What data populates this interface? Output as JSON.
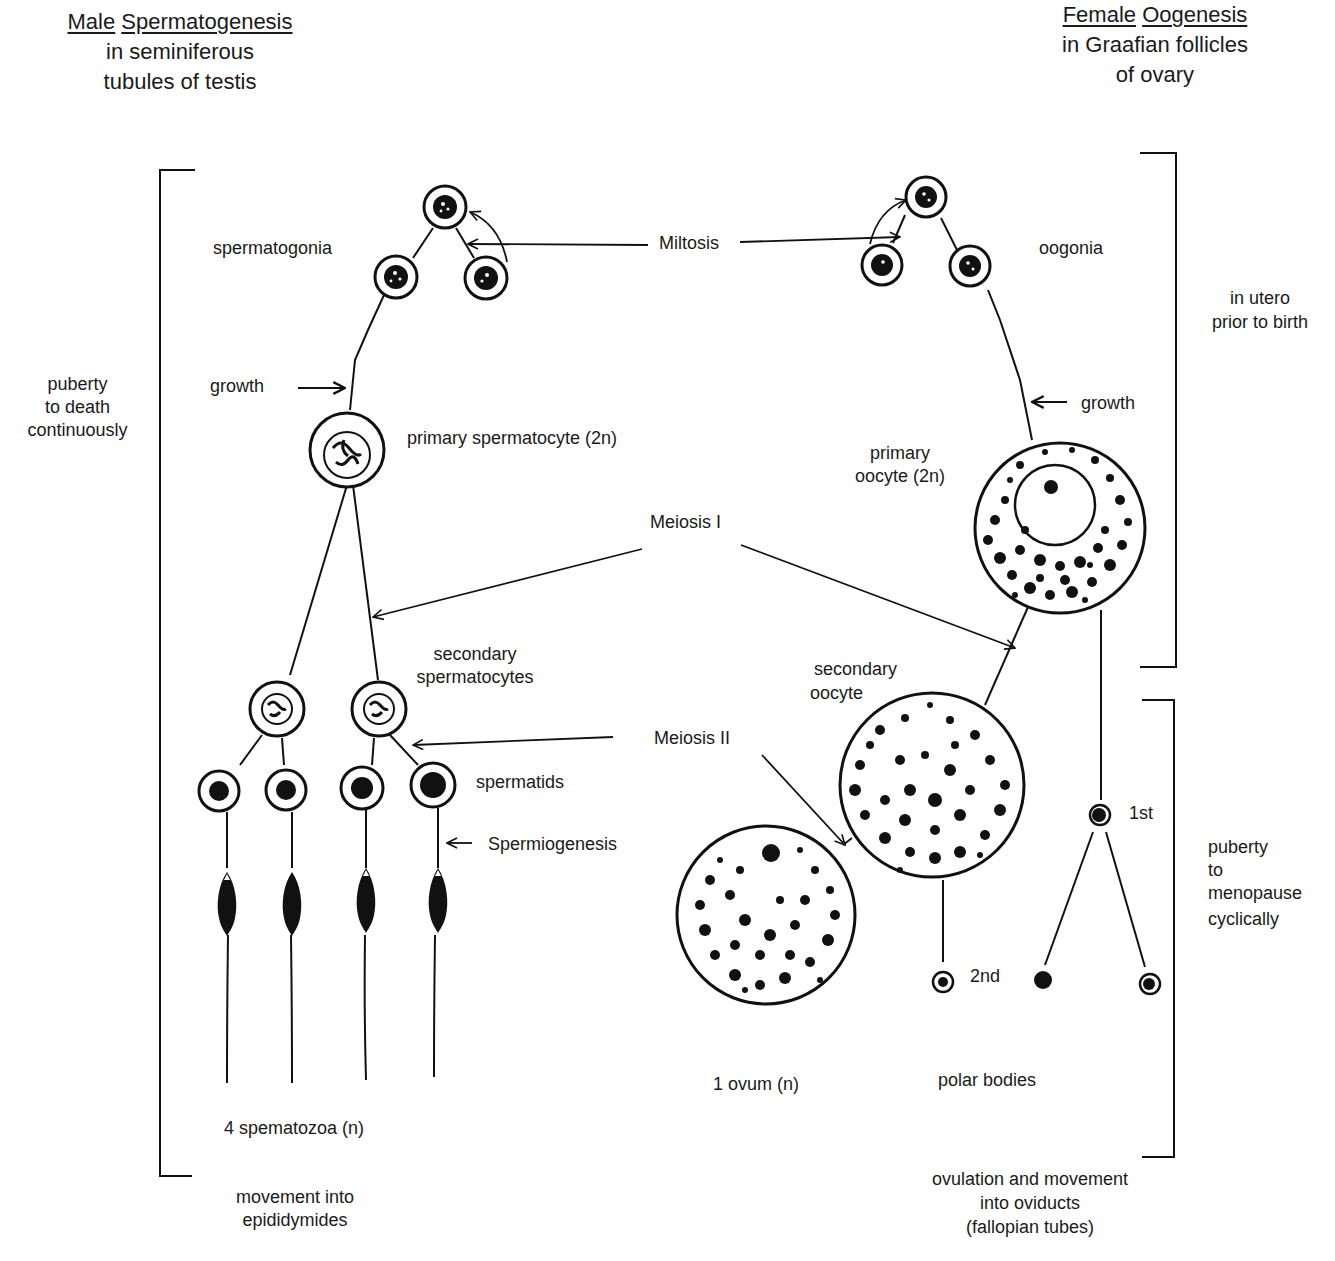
{
  "male": {
    "title_word1": "Male",
    "title_word2": "Spermatogenesis",
    "subtitle_line1": "in seminiferous",
    "subtitle_line2": "tubules of testis",
    "timing": [
      "puberty",
      "to death",
      "continuously"
    ],
    "stages": {
      "spermatogonia": "spermatogonia",
      "growth": "growth",
      "primary": "primary spermatocyte (2n)",
      "secondary_line1": "secondary",
      "secondary_line2": "spermatocytes",
      "spermatids": "spermatids",
      "spermiogenesis": "Spermiogenesis",
      "result": "4 spematozoa (n)"
    },
    "destination": [
      "movement into",
      "epididymides"
    ]
  },
  "female": {
    "title_word1": "Female",
    "title_word2": "Oogenesis",
    "subtitle_line1": "in Graafian follicles",
    "subtitle_line2": "of ovary",
    "timing_upper": [
      "in utero",
      "prior to birth"
    ],
    "timing_lower": [
      "puberty",
      "to",
      "menopause",
      "cyclically"
    ],
    "stages": {
      "oogonia": "oogonia",
      "growth": "growth",
      "primary_line1": "primary",
      "primary_line2": "oocyte (2n)",
      "secondary_line1": "secondary",
      "secondary_line2": "oocyte",
      "polar_1st": "1st",
      "polar_2nd": "2nd",
      "ovum": "1 ovum (n)",
      "polar_bodies": "polar bodies"
    },
    "destination": [
      "ovulation and movement",
      "into oviducts",
      "(fallopian tubes)"
    ]
  },
  "processes": {
    "mitosis": "Miltosis",
    "meiosis1": "Meiosis I",
    "meiosis2": "Meiosis II"
  }
}
